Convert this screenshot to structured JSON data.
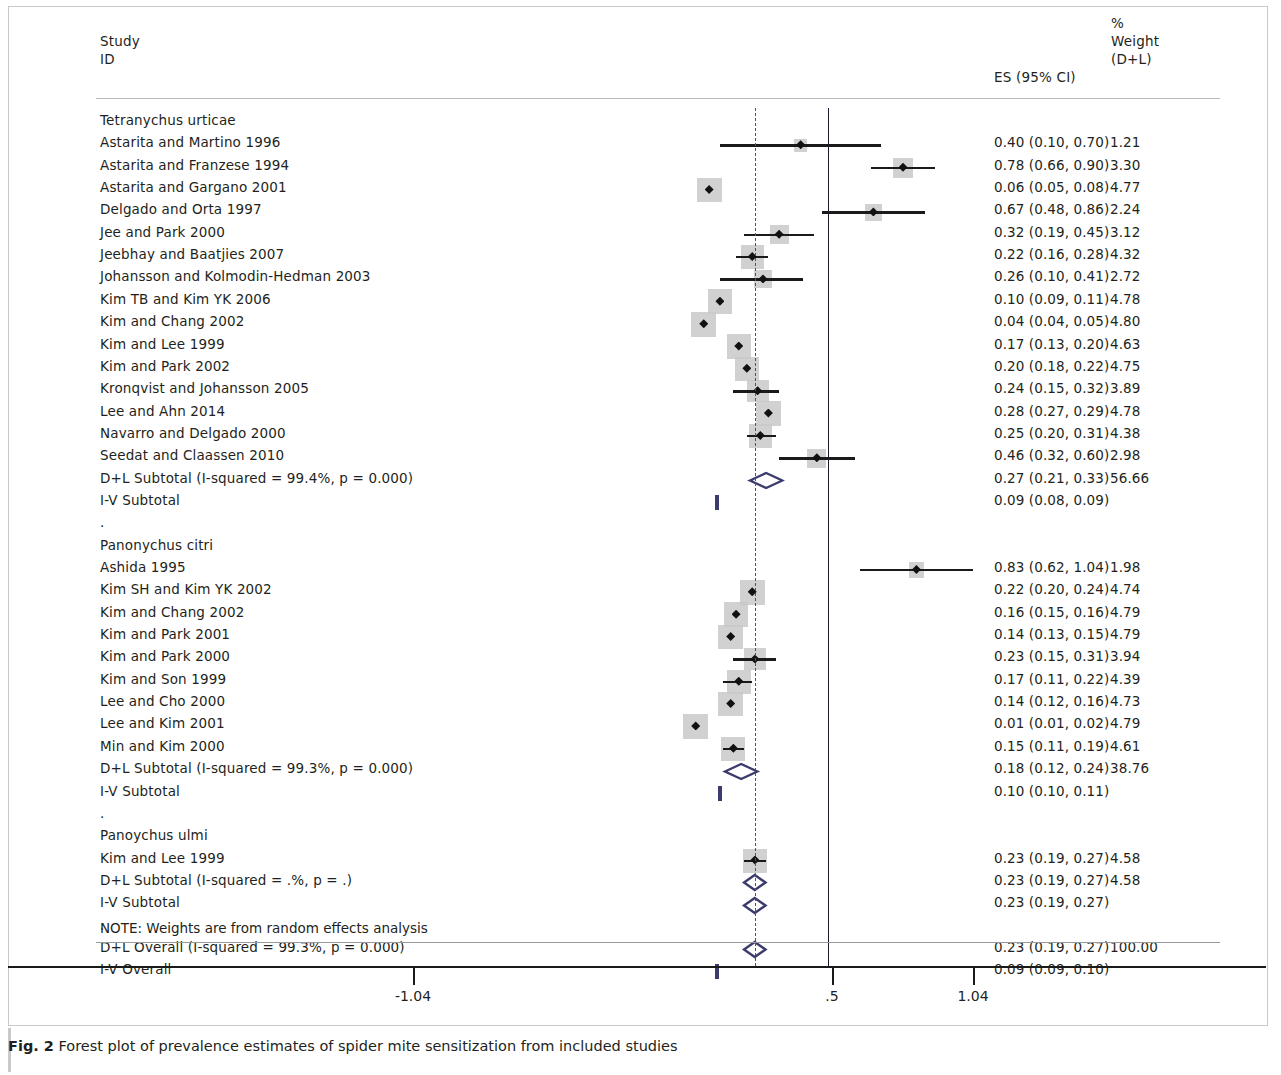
{
  "figure": {
    "number": "Fig. 2",
    "caption": "Forest plot of prevalence estimates of spider mite sensitization from included studies"
  },
  "header": {
    "study": "Study",
    "id": "ID",
    "es": "ES (95% CI)",
    "pct": "%",
    "weight": "Weight",
    "dl": "(D+L)"
  },
  "note": "NOTE: Weights are from random effects analysis",
  "axis": {
    "ticks": [
      {
        "label": "-1.04",
        "value": -1.04,
        "x": 413
      },
      {
        "label": ".5",
        "value": 0.5,
        "x": 832
      },
      {
        "label": "1.04",
        "value": 1.04,
        "x": 973
      }
    ],
    "null_line_value": 0.5,
    "dashed_line_value": 0.23
  },
  "chart_data": {
    "type": "forest",
    "title": "Forest plot of prevalence estimates of spider mite sensitization from included studies",
    "xlabel": "",
    "ylabel": "",
    "effect_measure": "ES (95% CI)",
    "weight_measure": "% Weight (D+L)",
    "xlim": [
      -1.04,
      1.04
    ],
    "null_line": 0.5,
    "dashed_line": 0.23,
    "groups": [
      {
        "name": "Tetranychus urticae",
        "studies": [
          {
            "label": "Astarita and Martino 1996",
            "es": 0.4,
            "lcl": 0.1,
            "ucl": 0.7,
            "es_text": "0.40 (0.10, 0.70)",
            "weight": "1.21"
          },
          {
            "label": "Astarita and Franzese 1994",
            "es": 0.78,
            "lcl": 0.66,
            "ucl": 0.9,
            "es_text": "0.78 (0.66, 0.90)",
            "weight": "3.30"
          },
          {
            "label": "Astarita and Gargano 2001",
            "es": 0.06,
            "lcl": 0.05,
            "ucl": 0.08,
            "es_text": "0.06 (0.05, 0.08)",
            "weight": "4.77"
          },
          {
            "label": "Delgado and Orta  1997",
            "es": 0.67,
            "lcl": 0.48,
            "ucl": 0.86,
            "es_text": "0.67 (0.48, 0.86)",
            "weight": "2.24"
          },
          {
            "label": "Jee and Park 2000",
            "es": 0.32,
            "lcl": 0.19,
            "ucl": 0.45,
            "es_text": "0.32 (0.19, 0.45)",
            "weight": "3.12"
          },
          {
            "label": "Jeebhay and Baatjies 2007",
            "es": 0.22,
            "lcl": 0.16,
            "ucl": 0.28,
            "es_text": "0.22 (0.16, 0.28)",
            "weight": "4.32"
          },
          {
            "label": "Johansson and Kolmodin-Hedman  2003",
            "es": 0.26,
            "lcl": 0.1,
            "ucl": 0.41,
            "es_text": "0.26 (0.10, 0.41)",
            "weight": "2.72"
          },
          {
            "label": "Kim TB and Kim YK 2006",
            "es": 0.1,
            "lcl": 0.09,
            "ucl": 0.11,
            "es_text": "0.10 (0.09, 0.11)",
            "weight": "4.78"
          },
          {
            "label": "Kim and Chang 2002",
            "es": 0.04,
            "lcl": 0.04,
            "ucl": 0.05,
            "es_text": "0.04 (0.04, 0.05)",
            "weight": "4.80"
          },
          {
            "label": "Kim and Lee 1999",
            "es": 0.17,
            "lcl": 0.13,
            "ucl": 0.2,
            "es_text": "0.17 (0.13, 0.20)",
            "weight": "4.63"
          },
          {
            "label": "Kim and Park 2002",
            "es": 0.2,
            "lcl": 0.18,
            "ucl": 0.22,
            "es_text": "0.20 (0.18, 0.22)",
            "weight": "4.75"
          },
          {
            "label": "Kronqvist and Johansson 2005",
            "es": 0.24,
            "lcl": 0.15,
            "ucl": 0.32,
            "es_text": "0.24 (0.15, 0.32)",
            "weight": "3.89"
          },
          {
            "label": "Lee and Ahn 2014",
            "es": 0.28,
            "lcl": 0.27,
            "ucl": 0.29,
            "es_text": "0.28 (0.27, 0.29)",
            "weight": "4.78"
          },
          {
            "label": "Navarro and Delgado 2000",
            "es": 0.25,
            "lcl": 0.2,
            "ucl": 0.31,
            "es_text": "0.25 (0.20, 0.31)",
            "weight": "4.38"
          },
          {
            "label": "Seedat and Claassen 2010",
            "es": 0.46,
            "lcl": 0.32,
            "ucl": 0.6,
            "es_text": "0.46 (0.32, 0.60)",
            "weight": "2.98"
          }
        ],
        "dl_subtotal": {
          "label": "D+L Subtotal  (I-squared = 99.4%, p = 0.000)",
          "es": 0.27,
          "lcl": 0.21,
          "ucl": 0.33,
          "es_text": "0.27 (0.21, 0.33)",
          "weight": "56.66"
        },
        "iv_subtotal": {
          "label": "I-V Subtotal",
          "es": 0.09,
          "lcl": 0.08,
          "ucl": 0.09,
          "es_text": "0.09 (0.08, 0.09)",
          "weight": ""
        }
      },
      {
        "name": "Panonychus citri",
        "studies": [
          {
            "label": "Ashida 1995",
            "es": 0.83,
            "lcl": 0.62,
            "ucl": 1.04,
            "es_text": "0.83 (0.62, 1.04)",
            "weight": "1.98"
          },
          {
            "label": "Kim SH and Kim YK 2002",
            "es": 0.22,
            "lcl": 0.2,
            "ucl": 0.24,
            "es_text": "0.22 (0.20, 0.24)",
            "weight": "4.74"
          },
          {
            "label": "Kim and Chang 2002",
            "es": 0.16,
            "lcl": 0.15,
            "ucl": 0.16,
            "es_text": "0.16 (0.15, 0.16)",
            "weight": "4.79"
          },
          {
            "label": "Kim and Park 2001",
            "es": 0.14,
            "lcl": 0.13,
            "ucl": 0.15,
            "es_text": "0.14 (0.13, 0.15)",
            "weight": "4.79"
          },
          {
            "label": "Kim and Park 2000",
            "es": 0.23,
            "lcl": 0.15,
            "ucl": 0.31,
            "es_text": "0.23 (0.15, 0.31)",
            "weight": "3.94"
          },
          {
            "label": "Kim and Son 1999",
            "es": 0.17,
            "lcl": 0.11,
            "ucl": 0.22,
            "es_text": "0.17 (0.11, 0.22)",
            "weight": "4.39"
          },
          {
            "label": "Lee and Cho 2000",
            "es": 0.14,
            "lcl": 0.12,
            "ucl": 0.16,
            "es_text": "0.14 (0.12, 0.16)",
            "weight": "4.73"
          },
          {
            "label": "Lee and Kim 2001",
            "es": 0.01,
            "lcl": 0.01,
            "ucl": 0.02,
            "es_text": "0.01 (0.01, 0.02)",
            "weight": "4.79"
          },
          {
            "label": "Min and Kim 2000",
            "es": 0.15,
            "lcl": 0.11,
            "ucl": 0.19,
            "es_text": "0.15 (0.11, 0.19)",
            "weight": "4.61"
          }
        ],
        "dl_subtotal": {
          "label": "D+L Subtotal  (I-squared = 99.3%, p = 0.000)",
          "es": 0.18,
          "lcl": 0.12,
          "ucl": 0.24,
          "es_text": "0.18 (0.12, 0.24)",
          "weight": "38.76"
        },
        "iv_subtotal": {
          "label": "I-V Subtotal",
          "es": 0.1,
          "lcl": 0.1,
          "ucl": 0.11,
          "es_text": "0.10 (0.10, 0.11)",
          "weight": ""
        }
      },
      {
        "name": "Panoychus ulmi",
        "studies": [
          {
            "label": "Kim and Lee 1999",
            "es": 0.23,
            "lcl": 0.19,
            "ucl": 0.27,
            "es_text": "0.23 (0.19, 0.27)",
            "weight": "4.58"
          }
        ],
        "dl_subtotal": {
          "label": "D+L Subtotal  (I-squared = .%, p = .)",
          "es": 0.23,
          "lcl": 0.19,
          "ucl": 0.27,
          "es_text": "0.23 (0.19, 0.27)",
          "weight": "4.58"
        },
        "iv_subtotal": {
          "label": "I-V Subtotal",
          "es": 0.23,
          "lcl": 0.19,
          "ucl": 0.27,
          "es_text": "0.23 (0.19, 0.27)",
          "weight": ""
        }
      }
    ],
    "overall": {
      "dl": {
        "label": "D+L Overall  (I-squared = 99.3%, p = 0.000)",
        "es": 0.23,
        "lcl": 0.19,
        "ucl": 0.27,
        "es_text": "0.23 (0.19, 0.27)",
        "weight": "100.00"
      },
      "iv": {
        "label": "I-V Overall",
        "es": 0.09,
        "lcl": 0.09,
        "ucl": 0.1,
        "es_text": "0.09 (0.09, 0.10)",
        "weight": ""
      }
    }
  }
}
